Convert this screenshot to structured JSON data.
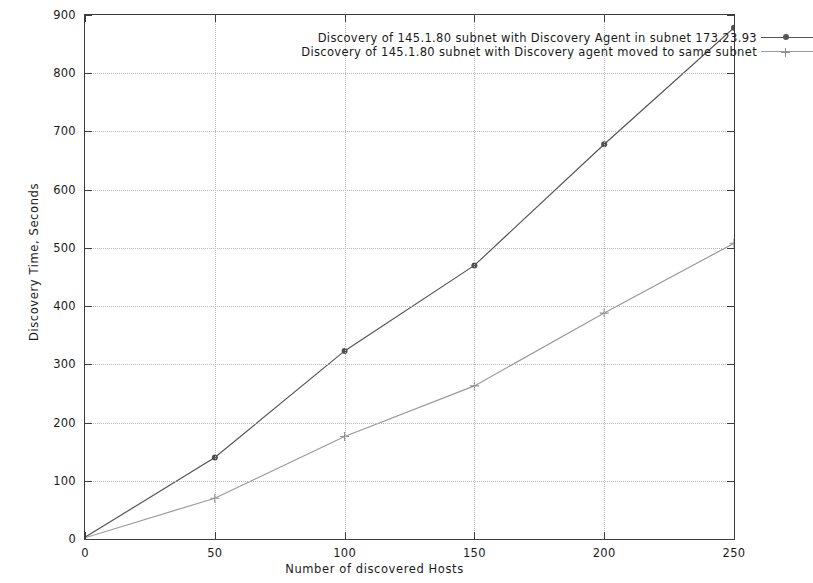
{
  "chart_data": {
    "type": "line",
    "title": "",
    "xlabel": "Number of discovered Hosts",
    "ylabel": "Discovery Time, Seconds",
    "xlim": [
      0,
      250
    ],
    "ylim": [
      0,
      900
    ],
    "xticks": [
      0,
      50,
      100,
      150,
      200,
      250
    ],
    "yticks": [
      0,
      100,
      200,
      300,
      400,
      500,
      600,
      700,
      800,
      900
    ],
    "grid": true,
    "legend_position": "top-center-inside",
    "x": [
      0,
      50,
      100,
      150,
      200,
      250
    ],
    "series": [
      {
        "name": "Discovery of 145.1.80 subnet with Discovery Agent in subnet 173.23.93",
        "marker": "dot",
        "color": "#555555",
        "values": [
          3,
          140,
          323,
          470,
          678,
          878
        ]
      },
      {
        "name": "Discovery of 145.1.80 subnet with Discovery agent moved to same subnet",
        "marker": "plus",
        "color": "#9a9a9a",
        "values": [
          2,
          70,
          176,
          263,
          388,
          508
        ]
      }
    ]
  },
  "axes": {
    "y_tick_labels": [
      "0",
      "100",
      "200",
      "300",
      "400",
      "500",
      "600",
      "700",
      "800",
      "900"
    ],
    "x_tick_labels": [
      "0",
      "50",
      "100",
      "150",
      "200",
      "250"
    ],
    "x_title": "Number of discovered Hosts",
    "y_title": "Discovery Time, Seconds"
  },
  "legend": {
    "entries": [
      {
        "label": "Discovery of 145.1.80 subnet with Discovery Agent in subnet 173.23.93",
        "marker": "dot"
      },
      {
        "label": "Discovery of 145.1.80 subnet with Discovery agent moved to same subnet",
        "marker": "plus"
      }
    ]
  }
}
